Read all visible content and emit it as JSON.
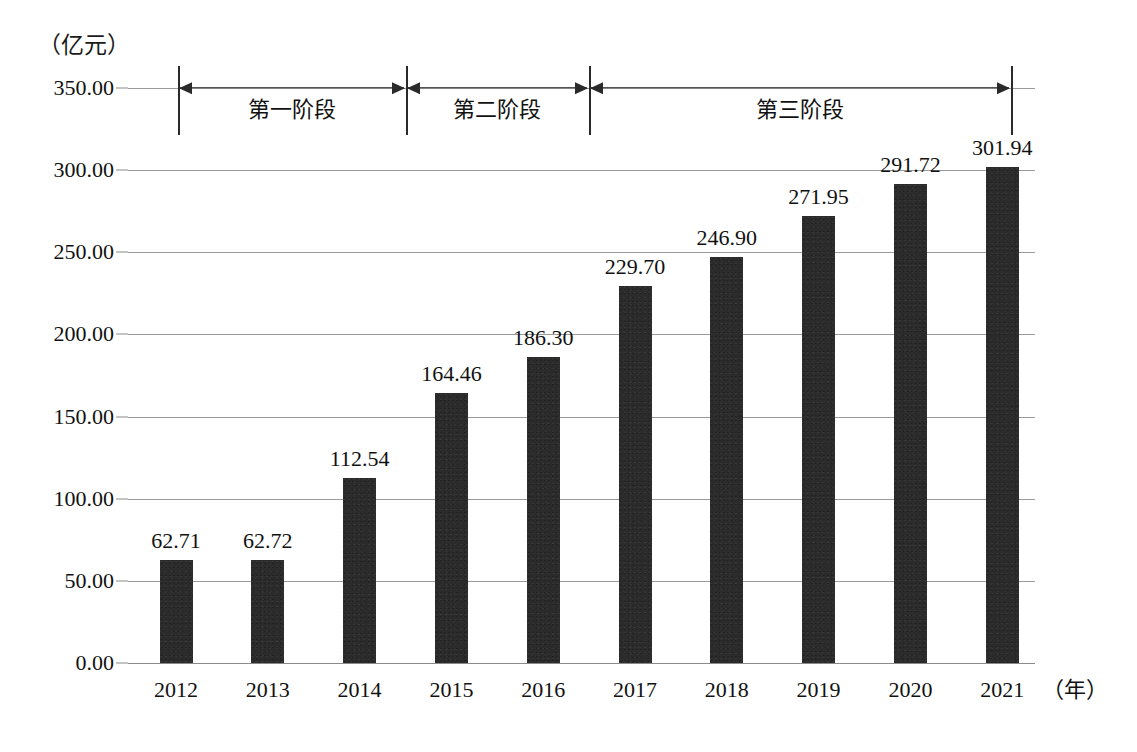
{
  "chart_data": {
    "type": "bar",
    "title": "",
    "xlabel": "（年）",
    "ylabel": "（亿元）",
    "categories": [
      "2012",
      "2013",
      "2014",
      "2015",
      "2016",
      "2017",
      "2018",
      "2019",
      "2020",
      "2021"
    ],
    "values": [
      62.71,
      62.72,
      112.54,
      164.46,
      186.3,
      229.7,
      246.9,
      271.95,
      291.72,
      301.94
    ],
    "value_labels": [
      "62.71",
      "62.72",
      "112.54",
      "164.46",
      "186.30",
      "229.70",
      "246.90",
      "271.95",
      "291.72",
      "301.94"
    ],
    "ylim": [
      0,
      350
    ],
    "ytick_labels": [
      "350.00",
      "300.00",
      "250.00",
      "200.00",
      "150.00",
      "100.00",
      "50.00",
      "0.00"
    ],
    "ytick_values": [
      350,
      300,
      250,
      200,
      150,
      100,
      50,
      0
    ],
    "grid": true,
    "legend": "none",
    "bar_color": "#2b2b2b",
    "gridline_color": "#9a9a9a",
    "annotations": [
      {
        "label": "第一阶段",
        "start_category": "2012",
        "end_category": "2014"
      },
      {
        "label": "第二阶段",
        "start_category": "2015",
        "end_category": "2016"
      },
      {
        "label": "第三阶段",
        "start_category": "2017",
        "end_category": "2021"
      }
    ]
  },
  "axis": {
    "y_unit_label": "（亿元）",
    "x_unit_label": "（年）"
  }
}
